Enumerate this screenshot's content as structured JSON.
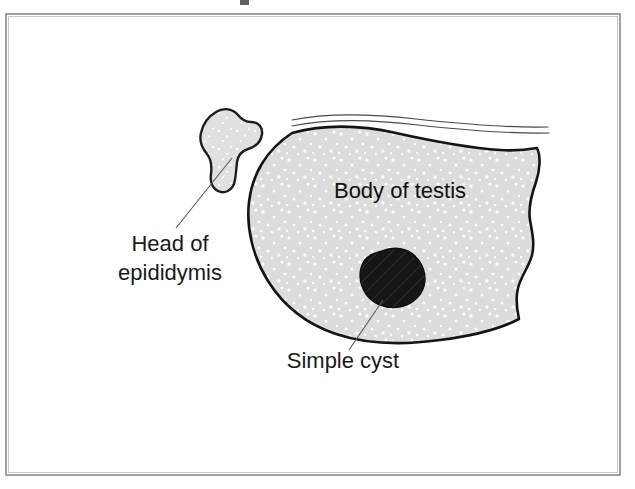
{
  "figure": {
    "background_color": "#ffffff",
    "frame": {
      "border_color": "#8a8a8a",
      "x": 6,
      "y": 14,
      "width": 614,
      "height": 461
    },
    "colors": {
      "organ_fill": "#dcdcdc",
      "organ_speckle": "#ffffff",
      "organ_outline": "#141414",
      "epididymis_fill": "#e0e0e0",
      "epididymis_outline": "#1c1c1c",
      "cyst_fill": "#161616",
      "leader_line": "#595959",
      "label_text": "#1a1a1a"
    },
    "labels": [
      {
        "id": "head-of-epididymis",
        "lines": [
          "Head of",
          "epididymis"
        ],
        "line1": "Head of",
        "line2": "epididymis",
        "x": 170,
        "y": 248,
        "anchor": "middle",
        "points_to": "epididymis"
      },
      {
        "id": "body-of-testis",
        "lines": [
          "Body of testis"
        ],
        "line1": "Body of testis",
        "x": 400,
        "y": 192,
        "anchor": "middle",
        "points_to": "testis-body"
      },
      {
        "id": "simple-cyst",
        "lines": [
          "Simple cyst"
        ],
        "line1": "Simple cyst",
        "x": 343,
        "y": 362,
        "anchor": "middle",
        "points_to": "cyst"
      }
    ],
    "structures": [
      {
        "id": "testis-body",
        "name": "Body of testis",
        "fill": "#dcdcdc",
        "texture": "speckled-gray"
      },
      {
        "id": "epididymis",
        "name": "Head of epididymis",
        "fill": "#e0e0e0",
        "texture": "speckled-gray"
      },
      {
        "id": "cyst",
        "name": "Simple cyst",
        "fill": "#161616",
        "texture": "solid-dark"
      },
      {
        "id": "fascia-lines",
        "name": "Overlying tissue layers",
        "count": 2
      }
    ]
  }
}
